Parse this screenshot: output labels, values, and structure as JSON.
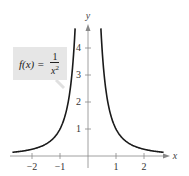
{
  "chart_data": {
    "type": "line",
    "title": "",
    "function": "f(x) = 1/x^2",
    "annotation": {
      "lhs": "f(x) =",
      "numerator": "1",
      "denominator": "x",
      "exponent": "2"
    },
    "xlabel": "x",
    "ylabel": "y",
    "xlim": [
      -2.7,
      2.8
    ],
    "ylim": [
      0,
      4.8
    ],
    "x_ticks": [
      -2,
      -1,
      1,
      2
    ],
    "x_tick_labels": [
      "−2",
      "−1",
      "1",
      "2"
    ],
    "y_ticks": [
      1,
      2,
      3,
      4
    ],
    "y_tick_labels": [
      "1",
      "2",
      "3",
      "4"
    ],
    "grid": false,
    "legend": null,
    "series": [
      {
        "name": "f(x) = 1/x^2 (left branch)",
        "x": [
          -2.7,
          -2.0,
          -1.5,
          -1.0,
          -0.8,
          -0.7,
          -0.6,
          -0.5,
          -0.46
        ],
        "y": [
          0.137,
          0.25,
          0.444,
          1.0,
          1.5625,
          2.041,
          2.778,
          4.0,
          4.73
        ]
      },
      {
        "name": "f(x) = 1/x^2 (right branch)",
        "x": [
          0.46,
          0.5,
          0.6,
          0.7,
          0.8,
          1.0,
          1.5,
          2.0,
          2.7
        ],
        "y": [
          4.73,
          4.0,
          2.778,
          2.041,
          1.5625,
          1.0,
          0.444,
          0.25,
          0.137
        ]
      }
    ],
    "colors": {
      "curve": "#1a1a1a",
      "axis": "#888888",
      "label_box": "#e6e6e6"
    }
  }
}
